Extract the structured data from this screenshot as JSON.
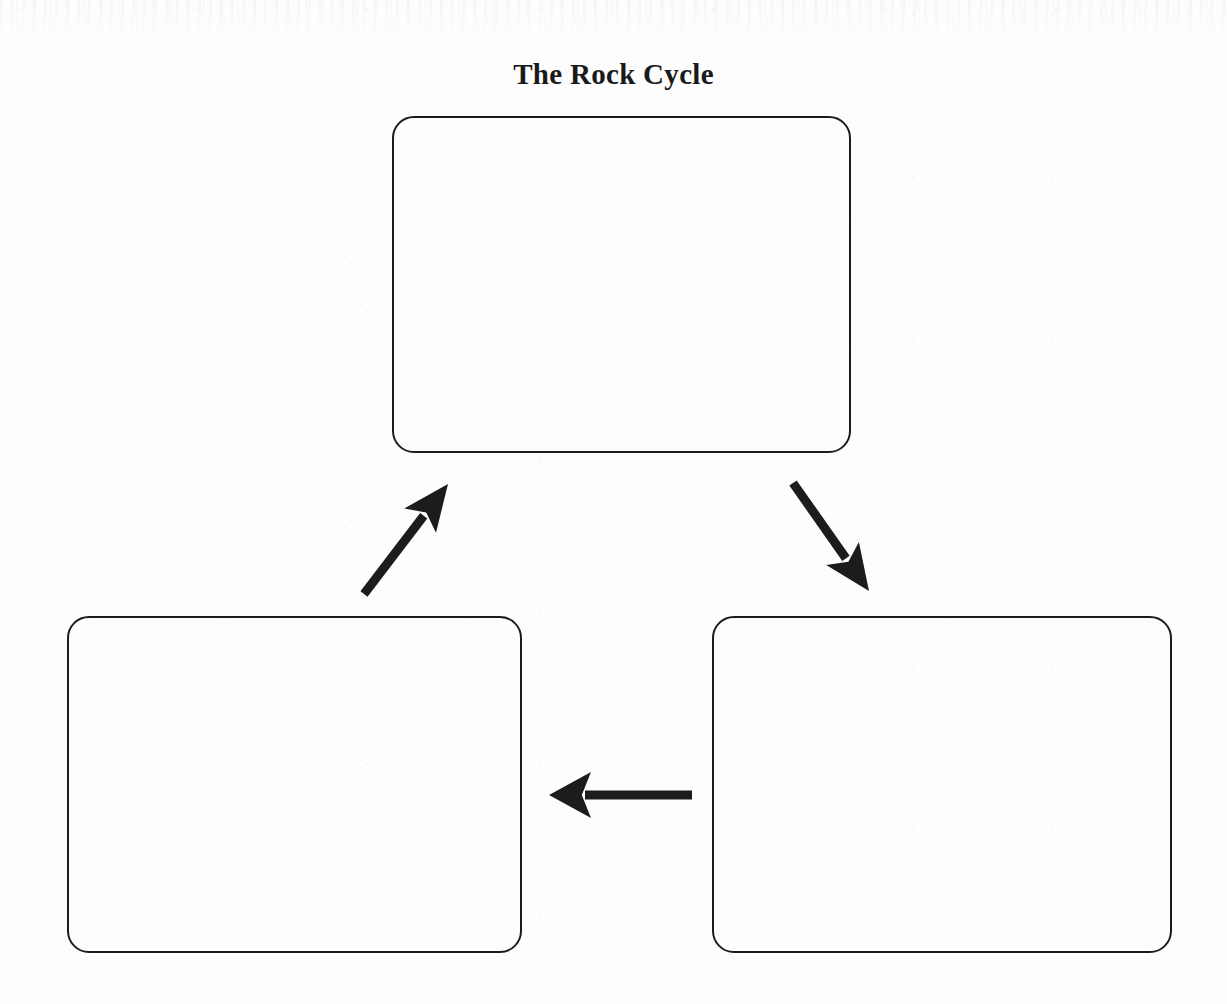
{
  "document": {
    "type": "worksheet-diagram",
    "title": "The Rock Cycle",
    "background_color": "#fdfdfd",
    "ink_color": "#1c1c1c"
  },
  "diagram": {
    "title": "The Rock Cycle",
    "layout": "triangular-cycle",
    "direction": "clockwise",
    "boxes": [
      {
        "id": "top",
        "label": "",
        "position": "top-center",
        "x": 392,
        "y": 116,
        "width": 459,
        "height": 337,
        "corner_radius": 22,
        "fill": "none",
        "stroke": "#1c1c1c",
        "stroke_width": 2,
        "state": "blank"
      },
      {
        "id": "bottom-left",
        "label": "",
        "position": "bottom-left",
        "x": 67,
        "y": 616,
        "width": 455,
        "height": 337,
        "corner_radius": 22,
        "fill": "none",
        "stroke": "#1c1c1c",
        "stroke_width": 2,
        "state": "blank"
      },
      {
        "id": "bottom-right",
        "label": "",
        "position": "bottom-right",
        "x": 712,
        "y": 616,
        "width": 460,
        "height": 337,
        "corner_radius": 22,
        "fill": "none",
        "stroke": "#1c1c1c",
        "stroke_width": 2,
        "state": "blank"
      }
    ],
    "arrows": [
      {
        "id": "top-to-right",
        "from": "top",
        "to": "bottom-right",
        "direction": "down-right",
        "tail": {
          "x": 793,
          "y": 483
        },
        "tip": {
          "x": 869,
          "y": 591
        },
        "color": "#1c1c1c",
        "shaft_width": 9,
        "head_length": 46,
        "head_width": 40
      },
      {
        "id": "right-to-left",
        "from": "bottom-right",
        "to": "bottom-left",
        "direction": "left",
        "tail": {
          "x": 692,
          "y": 795
        },
        "tip": {
          "x": 549,
          "y": 795
        },
        "color": "#1c1c1c",
        "shaft_width": 9,
        "head_length": 42,
        "head_width": 46
      },
      {
        "id": "left-to-top",
        "from": "bottom-left",
        "to": "top",
        "direction": "up-right",
        "tail": {
          "x": 364,
          "y": 594
        },
        "tip": {
          "x": 448,
          "y": 484
        },
        "color": "#1c1c1c",
        "shaft_width": 9,
        "head_length": 46,
        "head_width": 40
      }
    ]
  }
}
